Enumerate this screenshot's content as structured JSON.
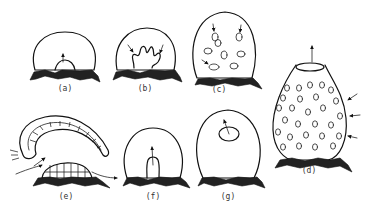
{
  "figure": {
    "panels": [
      {
        "id": "a",
        "label": "(a)",
        "label_x": 65,
        "label_y": 90
      },
      {
        "id": "b",
        "label": "(b)",
        "label_x": 145,
        "label_y": 90
      },
      {
        "id": "c",
        "label": "(c)",
        "label_x": 219,
        "label_y": 90
      },
      {
        "id": "d",
        "label": "(d)",
        "label_x": 309,
        "label_y": 170
      },
      {
        "id": "e",
        "label": "(e)",
        "label_x": 66,
        "label_y": 194
      },
      {
        "id": "f",
        "label": "(f)",
        "label_x": 153,
        "label_y": 194
      },
      {
        "id": "g",
        "label": "(g)",
        "label_x": 228,
        "label_y": 194
      }
    ]
  }
}
